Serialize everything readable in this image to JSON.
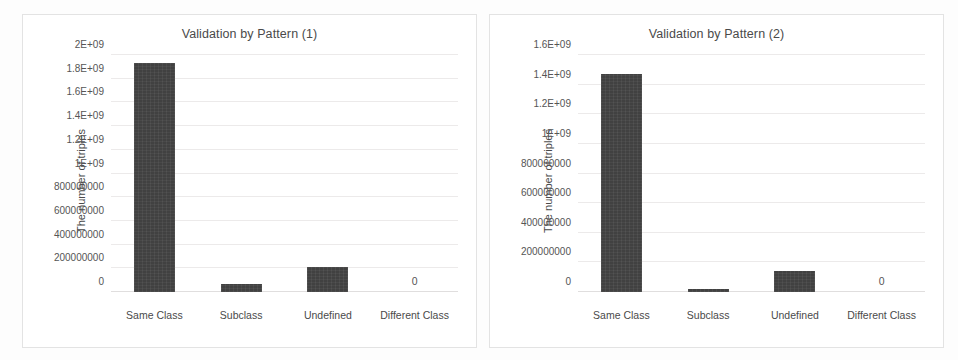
{
  "figure": {
    "background": "#fdfdfd",
    "bar_color": "#414141",
    "grid_color": "#eceaea",
    "text_color": "#4a4a4a"
  },
  "chart_data": [
    {
      "type": "bar",
      "id": "validation-by-pattern-1",
      "title": "Validation by Pattern (1)",
      "xlabel": "",
      "ylabel": "The number of triples",
      "categories": [
        "Same Class",
        "Subclass",
        "Undefined",
        "Different Class"
      ],
      "values": [
        1930000000,
        70000000,
        215000000,
        0
      ],
      "point_labels": [
        "",
        "",
        "",
        "0"
      ],
      "ylim": [
        0,
        2000000000
      ],
      "yticks": [
        0,
        200000000,
        400000000,
        600000000,
        800000000,
        1000000000,
        1200000000,
        1400000000,
        1600000000,
        1800000000,
        2000000000
      ],
      "ytick_labels": [
        "0",
        "200000000",
        "400000000",
        "600000000",
        "800000000",
        "1E+09",
        "1.2E+09",
        "1.4E+09",
        "1.6E+09",
        "1.8E+09",
        "2E+09"
      ],
      "grid": true,
      "legend": false
    },
    {
      "type": "bar",
      "id": "validation-by-pattern-2",
      "title": "Validation by Pattern (2)",
      "xlabel": "",
      "ylabel": "The number of triples",
      "categories": [
        "Same Class",
        "Subclass",
        "Undefined",
        "Different Class"
      ],
      "values": [
        1475000000,
        20000000,
        140000000,
        0
      ],
      "point_labels": [
        "",
        "",
        "",
        "0"
      ],
      "ylim": [
        0,
        1600000000
      ],
      "yticks": [
        0,
        200000000,
        400000000,
        600000000,
        800000000,
        1000000000,
        1200000000,
        1400000000,
        1600000000
      ],
      "ytick_labels": [
        "0",
        "200000000",
        "400000000",
        "600000000",
        "800000000",
        "1E+09",
        "1.2E+09",
        "1.4E+09",
        "1.6E+09"
      ],
      "grid": true,
      "legend": false
    }
  ]
}
